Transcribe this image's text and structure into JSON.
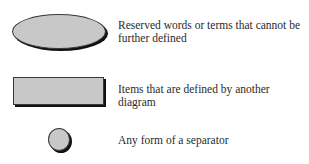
{
  "legend": {
    "items": [
      {
        "shape": "ellipse",
        "description": "Reserved words or terms that cannot be further defined",
        "fill": "#c8c8c8"
      },
      {
        "shape": "rectangle",
        "description": "Items that are defined by another diagram",
        "fill": "#c8c8c8"
      },
      {
        "shape": "circle",
        "description": "Any form of a separator",
        "fill": "#c8c8c8"
      }
    ]
  }
}
